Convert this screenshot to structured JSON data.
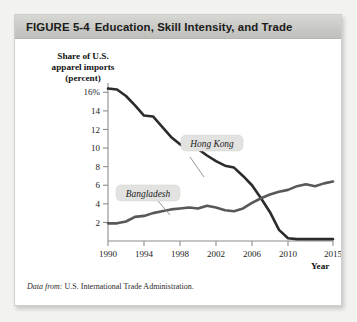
{
  "figure": {
    "number_label": "FIGURE  5-4",
    "title": "Education, Skill Intensity, and Trade",
    "source_label": "Data from:",
    "source_text": "U.S. International Trade Administration."
  },
  "chart_data": {
    "type": "line",
    "title": "Education, Skill Intensity, and Trade",
    "xlabel": "Year",
    "ylabel": "Share of U.S. apparel imports (percent)",
    "ylabel_lines": [
      "Share of U.S.",
      "apparel imports",
      "(percent)"
    ],
    "xlim": [
      1990,
      2015
    ],
    "ylim": [
      0,
      17
    ],
    "grid": false,
    "legend_position": "inline-callout",
    "ytick_labels": [
      "16%",
      "14",
      "12",
      "10",
      "8",
      "6",
      "4",
      "2"
    ],
    "ytick_values": [
      16,
      14,
      12,
      10,
      8,
      6,
      4,
      2
    ],
    "xtick_labels": [
      "1990",
      "1994",
      "1998",
      "2002",
      "2006",
      "2010",
      "2015"
    ],
    "xtick_values": [
      1990,
      1994,
      1998,
      2002,
      2006,
      2010,
      2015
    ],
    "x": [
      1990,
      1991,
      1992,
      1993,
      1994,
      1995,
      1996,
      1997,
      1998,
      1999,
      2000,
      2001,
      2002,
      2003,
      2004,
      2005,
      2006,
      2007,
      2008,
      2009,
      2010,
      2011,
      2012,
      2013,
      2014,
      2015
    ],
    "series": [
      {
        "name": "Hong Kong",
        "color": "#2b2b2b",
        "values": [
          16.4,
          16.3,
          15.6,
          14.6,
          13.5,
          13.4,
          12.3,
          11.2,
          10.4,
          9.9,
          9.9,
          9.2,
          8.6,
          8.1,
          7.9,
          7.0,
          6.0,
          4.6,
          3.1,
          1.2,
          0.3,
          0.2,
          0.2,
          0.2,
          0.2,
          0.2
        ]
      },
      {
        "name": "Bangladesh",
        "color": "#58585a",
        "values": [
          1.9,
          1.9,
          2.1,
          2.6,
          2.7,
          3.0,
          3.2,
          3.4,
          3.5,
          3.6,
          3.5,
          3.8,
          3.6,
          3.3,
          3.2,
          3.5,
          4.1,
          4.6,
          5.0,
          5.3,
          5.5,
          5.9,
          6.1,
          5.9,
          6.2,
          6.4
        ]
      }
    ],
    "annotations": [
      {
        "text": "Hong Kong",
        "for_series": "Hong Kong"
      },
      {
        "text": "Bangladesh",
        "for_series": "Bangladesh"
      }
    ]
  }
}
